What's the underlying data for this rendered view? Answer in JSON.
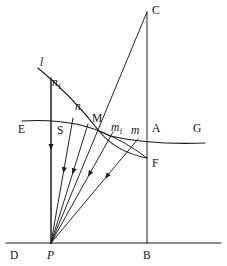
{
  "figure": {
    "colors": {
      "ink": "#1a1a1a",
      "background": "#ffffff",
      "label": "#111111"
    },
    "canvas": {
      "width": 227,
      "height": 266
    }
  },
  "labels": [
    {
      "id": "C",
      "text": "C",
      "x": 152,
      "y": 14,
      "style": "roman"
    },
    {
      "id": "l",
      "text": "l",
      "x": 40,
      "y": 66,
      "style": "italic"
    },
    {
      "id": "nf",
      "text": "n",
      "sub": "f",
      "x": 52,
      "y": 86,
      "style": "italic"
    },
    {
      "id": "n",
      "text": "n",
      "x": 75,
      "y": 110,
      "style": "italic"
    },
    {
      "id": "M",
      "text": "M",
      "x": 92,
      "y": 122,
      "style": "roman"
    },
    {
      "id": "E",
      "text": "E",
      "x": 18,
      "y": 133,
      "style": "roman"
    },
    {
      "id": "S",
      "text": "S",
      "x": 57,
      "y": 134,
      "style": "roman"
    },
    {
      "id": "mf",
      "text": "m",
      "sub": "f",
      "x": 111,
      "y": 131,
      "style": "italic"
    },
    {
      "id": "m",
      "text": "m",
      "x": 131,
      "y": 134,
      "style": "italic"
    },
    {
      "id": "A",
      "text": "A",
      "x": 152,
      "y": 132,
      "style": "roman"
    },
    {
      "id": "G",
      "text": "G",
      "x": 193,
      "y": 132,
      "style": "roman"
    },
    {
      "id": "F",
      "text": "F",
      "x": 152,
      "y": 167,
      "style": "roman"
    },
    {
      "id": "D",
      "text": "D",
      "x": 10,
      "y": 259,
      "style": "roman"
    },
    {
      "id": "P",
      "text": "P",
      "x": 47,
      "y": 259,
      "style": "italic"
    },
    {
      "id": "B",
      "text": "B",
      "x": 143,
      "y": 259,
      "style": "roman"
    }
  ],
  "points": {
    "P": {
      "x": 51,
      "y": 243
    },
    "B": {
      "x": 147,
      "y": 243
    },
    "C": {
      "x": 147,
      "y": 12
    },
    "M": {
      "x": 99,
      "y": 131
    },
    "F": {
      "x": 147,
      "y": 158
    },
    "A": {
      "x": 147,
      "y": 138
    }
  },
  "paths": {
    "baseline_DB": "M 6 243 L 221 243",
    "vertical_BC": "M 147 243 L 147 12",
    "vertical_PS": "M 51 243 L 51 78",
    "ray_P_to_C": "M 51 243 L 147 12",
    "curve_l": "M 38 68 Q 72 96 99 131 Q 116 152 147 158",
    "curve_EG": "M 22 121 Q 76 118 110 136 Q 150 145 205 143"
  },
  "rays": [
    {
      "id": "ray-1-vertical",
      "from_x": 51,
      "from_y": 243,
      "to_x": 51,
      "to_y": 78,
      "arrow_t": 0.58
    },
    {
      "id": "ray-2-S",
      "from_x": 51,
      "from_y": 243,
      "to_x": 73,
      "to_y": 118,
      "arrow_t": 0.58
    },
    {
      "id": "ray-3-n",
      "from_x": 51,
      "from_y": 243,
      "to_x": 88,
      "to_y": 124,
      "arrow_t": 0.6
    },
    {
      "id": "ray-4-M",
      "from_x": 51,
      "from_y": 243,
      "to_x": 113,
      "to_y": 132,
      "arrow_t": 0.62
    },
    {
      "id": "ray-5-m",
      "from_x": 51,
      "from_y": 243,
      "to_x": 138,
      "to_y": 139,
      "arrow_t": 0.64
    }
  ],
  "chord_M_F": "M 99 131 Q 125 141 147 158"
}
